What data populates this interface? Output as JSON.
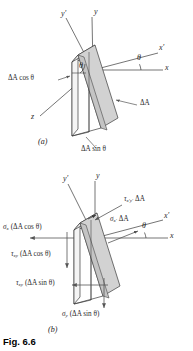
{
  "figure": {
    "caption": "Fig. 6.6",
    "panel_a_label": "(a)",
    "panel_b_label": "(b)"
  },
  "colors": {
    "line": "#3a3a3a",
    "face_shade": "#d2d2d2",
    "face_light": "#e6e6e6",
    "arrow": "#555555",
    "text": "#2b2b2b",
    "caption": "#000000"
  },
  "panel_a": {
    "axes": [
      {
        "name": "y-prime-axis-label",
        "text": "y′"
      },
      {
        "name": "y-axis-label",
        "text": "y"
      },
      {
        "name": "x-prime-axis-label",
        "text": "x′"
      },
      {
        "name": "x-axis-label",
        "text": "x"
      },
      {
        "name": "z-axis-label",
        "text": "z"
      }
    ],
    "angles": [
      {
        "name": "theta-apex",
        "text": "θ"
      },
      {
        "name": "theta-x-axis",
        "text": "θ"
      }
    ],
    "areas": [
      {
        "name": "area-cos-label",
        "text": "ΔA cos θ"
      },
      {
        "name": "area-label",
        "text": "ΔA"
      },
      {
        "name": "area-sin-label",
        "text": "ΔA sin θ"
      }
    ]
  },
  "panel_b": {
    "axes": [
      {
        "name": "y-prime-axis-label",
        "text": "y′"
      },
      {
        "name": "y-axis-label",
        "text": "y"
      },
      {
        "name": "x-prime-axis-label",
        "text": "x′"
      },
      {
        "name": "x-axis-label",
        "text": "x"
      }
    ],
    "angles": [
      {
        "name": "theta-x-axis",
        "text": "θ"
      }
    ],
    "forces": [
      {
        "name": "tau-xprime-yprime-force",
        "sym": "τ",
        "sub": "x′y′",
        "expr": "ΔA"
      },
      {
        "name": "sigma-xprime-force",
        "sym": "σ",
        "sub": "x′",
        "expr": "ΔA"
      },
      {
        "name": "sigma-x-force",
        "sym": "σ",
        "sub": "x",
        "expr": "(ΔA cos θ)"
      },
      {
        "name": "tau-xy-cos-force",
        "sym": "τ",
        "sub": "xy",
        "expr": "(ΔA cos θ)"
      },
      {
        "name": "tau-xy-sin-force",
        "sym": "τ",
        "sub": "xy",
        "expr": "(ΔA sin θ)"
      },
      {
        "name": "sigma-y-force",
        "sym": "σ",
        "sub": "y",
        "expr": "(ΔA sin θ)"
      }
    ]
  }
}
